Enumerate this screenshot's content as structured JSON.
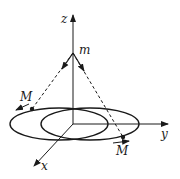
{
  "diagram": {
    "labels": {
      "z_axis": "z",
      "y_axis": "y",
      "x_axis": "x",
      "apex": "m",
      "mass_left": "M",
      "mass_right": "M"
    },
    "colors": {
      "stroke": "#1a1a1a",
      "background": "#ffffff"
    }
  }
}
